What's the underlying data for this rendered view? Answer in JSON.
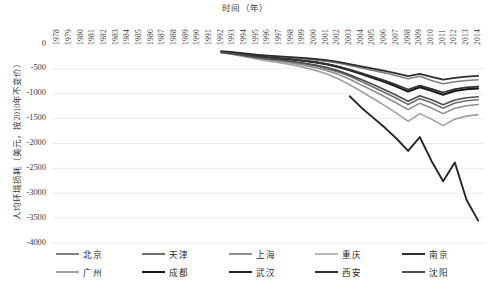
{
  "chart_data": {
    "type": "line",
    "title": "",
    "xlabel": "时间（年）",
    "ylabel": "人均环境损耗（美元，按2010年不变价）",
    "grid": true,
    "legend_position": "bottom",
    "xlim": [
      1978,
      2014
    ],
    "ylim": [
      -4000,
      0
    ],
    "ytick_step": 500,
    "x": [
      1978,
      1979,
      1980,
      1981,
      1982,
      1983,
      1984,
      1985,
      1986,
      1987,
      1988,
      1989,
      1990,
      1991,
      1992,
      1993,
      1994,
      1995,
      1996,
      1997,
      1998,
      1999,
      2000,
      2001,
      2002,
      2003,
      2004,
      2005,
      2006,
      2007,
      2008,
      2009,
      2010,
      2011,
      2012,
      2013,
      2014
    ],
    "xtick_labels": [
      "1978",
      "1979",
      "1980",
      "1981",
      "1982",
      "1983",
      "1984",
      "1985",
      "1986",
      "1987",
      "1988",
      "1989",
      "1990",
      "1991",
      "1992",
      "1993",
      "1994",
      "1995",
      "1996",
      "1997",
      "1998",
      "1999",
      "2000",
      "2001",
      "2002",
      "2003",
      "2004",
      "2005",
      "2006",
      "2007",
      "2008",
      "2009",
      "2010",
      "2011",
      "2012",
      "2013",
      "2014"
    ],
    "ytick_labels": [
      "0",
      "-500",
      "-1000",
      "-1500",
      "-2000",
      "-2500",
      "-3000",
      "-3500",
      "-4000"
    ],
    "ytick_values": [
      0,
      -500,
      -1000,
      -1500,
      -2000,
      -2500,
      -3000,
      -3500,
      -4000
    ],
    "series": [
      {
        "name": "北京",
        "color": "#808080",
        "width": 1.6,
        "values": [
          null,
          null,
          null,
          null,
          null,
          null,
          null,
          null,
          null,
          null,
          null,
          null,
          null,
          null,
          -150,
          -175,
          -205,
          -235,
          -255,
          -270,
          -285,
          -300,
          -320,
          -345,
          -380,
          -430,
          -480,
          -530,
          -580,
          -640,
          -700,
          -650,
          -735,
          -800,
          -760,
          -735,
          -720
        ]
      },
      {
        "name": "天津",
        "color": "#6e6e6e",
        "width": 1.6,
        "values": [
          null,
          null,
          null,
          null,
          null,
          null,
          null,
          null,
          null,
          null,
          null,
          null,
          null,
          null,
          -165,
          -195,
          -235,
          -275,
          -305,
          -330,
          -360,
          -395,
          -435,
          -490,
          -560,
          -650,
          -755,
          -865,
          -975,
          -1090,
          -1215,
          -1095,
          -1180,
          -1290,
          -1185,
          -1140,
          -1120
        ]
      },
      {
        "name": "上海",
        "color": "#8f8f8f",
        "width": 1.6,
        "values": [
          null,
          null,
          null,
          null,
          null,
          null,
          null,
          null,
          null,
          null,
          null,
          null,
          null,
          null,
          -170,
          -200,
          -240,
          -280,
          -315,
          -345,
          -380,
          -420,
          -470,
          -530,
          -610,
          -710,
          -825,
          -940,
          -1060,
          -1185,
          -1320,
          -1190,
          -1285,
          -1400,
          -1290,
          -1240,
          -1215
        ]
      },
      {
        "name": "重庆",
        "color": "#b7b7b7",
        "width": 1.6,
        "values": [
          null,
          null,
          null,
          null,
          null,
          null,
          null,
          null,
          null,
          null,
          null,
          null,
          null,
          null,
          -155,
          -180,
          -210,
          -240,
          -265,
          -285,
          -305,
          -330,
          -360,
          -400,
          -455,
          -525,
          -600,
          -680,
          -760,
          -850,
          -950,
          -865,
          -935,
          -1015,
          -935,
          -900,
          -885
        ]
      },
      {
        "name": "南京",
        "color": "#2d2d2d",
        "width": 1.8,
        "values": [
          null,
          null,
          null,
          null,
          null,
          null,
          null,
          null,
          null,
          null,
          null,
          null,
          null,
          null,
          -145,
          -165,
          -190,
          -215,
          -235,
          -250,
          -265,
          -280,
          -300,
          -325,
          -360,
          -405,
          -450,
          -495,
          -540,
          -590,
          -645,
          -600,
          -660,
          -715,
          -680,
          -655,
          -640
        ]
      },
      {
        "name": "广州",
        "color": "#a0a0a0",
        "width": 1.6,
        "values": [
          null,
          null,
          null,
          null,
          null,
          null,
          null,
          null,
          null,
          null,
          null,
          null,
          null,
          null,
          -175,
          -210,
          -255,
          -300,
          -340,
          -375,
          -415,
          -465,
          -525,
          -600,
          -700,
          -820,
          -955,
          -1095,
          -1240,
          -1390,
          -1555,
          -1400,
          -1510,
          -1640,
          -1510,
          -1450,
          -1420
        ]
      },
      {
        "name": "成都",
        "color": "#1a1a1a",
        "width": 1.9,
        "values": [
          null,
          null,
          null,
          null,
          null,
          null,
          null,
          null,
          null,
          null,
          null,
          null,
          null,
          null,
          -160,
          -185,
          -215,
          -245,
          -270,
          -290,
          -312,
          -338,
          -368,
          -408,
          -462,
          -530,
          -605,
          -685,
          -765,
          -855,
          -955,
          -870,
          -940,
          -1020,
          -945,
          -910,
          -895
        ]
      },
      {
        "name": "武汉",
        "color": "#262626",
        "width": 1.9,
        "values": [
          null,
          null,
          null,
          null,
          null,
          null,
          null,
          null,
          null,
          null,
          null,
          null,
          null,
          null,
          null,
          null,
          null,
          null,
          null,
          null,
          null,
          null,
          null,
          null,
          null,
          -1050,
          -1280,
          -1480,
          -1680,
          -1900,
          -2150,
          -1870,
          -2350,
          -2760,
          -2380,
          -3130,
          -3550
        ]
      },
      {
        "name": "西安",
        "color": "#333333",
        "width": 1.8,
        "values": [
          null,
          null,
          null,
          null,
          null,
          null,
          null,
          null,
          null,
          null,
          null,
          null,
          null,
          null,
          -158,
          -182,
          -212,
          -242,
          -268,
          -288,
          -310,
          -335,
          -362,
          -400,
          -450,
          -515,
          -585,
          -660,
          -735,
          -820,
          -915,
          -835,
          -900,
          -975,
          -905,
          -872,
          -858
        ]
      },
      {
        "name": "沈阳",
        "color": "#4d4d4d",
        "width": 1.7,
        "values": [
          null,
          null,
          null,
          null,
          null,
          null,
          null,
          null,
          null,
          null,
          null,
          null,
          null,
          null,
          -168,
          -198,
          -232,
          -268,
          -298,
          -322,
          -350,
          -382,
          -418,
          -468,
          -535,
          -620,
          -715,
          -815,
          -920,
          -1030,
          -1150,
          -1040,
          -1120,
          -1220,
          -1125,
          -1080,
          -1060
        ]
      }
    ]
  },
  "legend": {
    "rows": [
      [
        {
          "label": "北京",
          "color": "#808080",
          "width": 1.6
        },
        {
          "label": "天津",
          "color": "#6e6e6e",
          "width": 1.6
        },
        {
          "label": "上海",
          "color": "#8f8f8f",
          "width": 1.6
        },
        {
          "label": "重庆",
          "color": "#b7b7b7",
          "width": 1.6
        },
        {
          "label": "南京",
          "color": "#2d2d2d",
          "width": 1.8
        }
      ],
      [
        {
          "label": "广州",
          "color": "#a0a0a0",
          "width": 1.6
        },
        {
          "label": "成都",
          "color": "#1a1a1a",
          "width": 1.9
        },
        {
          "label": "武汉",
          "color": "#262626",
          "width": 1.9
        },
        {
          "label": "西安",
          "color": "#333333",
          "width": 1.8
        },
        {
          "label": "沈阳",
          "color": "#4d4d4d",
          "width": 1.7
        }
      ]
    ]
  },
  "style": {
    "grid_color": "#eceaea",
    "background": "#ffffff",
    "tick_text_color": "#3d3d3d"
  }
}
